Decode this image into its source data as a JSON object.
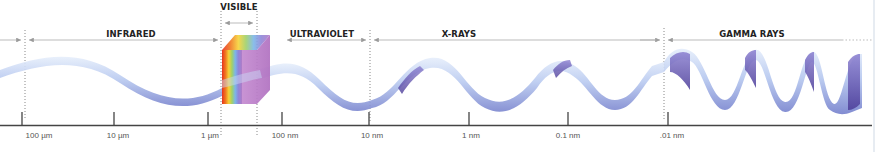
{
  "diagram": {
    "type": "electromagnetic-spectrum",
    "bands": [
      {
        "id": "infrared",
        "label": "INFRARED",
        "x_center": 123,
        "y": 29
      },
      {
        "id": "visible",
        "label": "VISIBLE",
        "x_center": 239,
        "y": 2
      },
      {
        "id": "ultraviolet",
        "label": "ULTRAVIOLET",
        "x_center": 313,
        "y": 29
      },
      {
        "id": "x-rays",
        "label": "X-RAYS",
        "x_center": 458,
        "y": 29
      },
      {
        "id": "gamma-rays",
        "label": "GAMMA RAYS",
        "x_center": 753,
        "y": 29
      }
    ],
    "axis": {
      "ticks": [
        {
          "x": 22,
          "label": "100 µm",
          "label_x": 39
        },
        {
          "x": 114,
          "label": "10 µm",
          "label_x": 118
        },
        {
          "x": 208,
          "label": "1 µm",
          "label_x": 210
        },
        {
          "x": 282,
          "label": "100 nm",
          "label_x": 285
        },
        {
          "x": 369,
          "label": "10 nm",
          "label_x": 372
        },
        {
          "x": 469,
          "label": "1 nm",
          "label_x": 471
        },
        {
          "x": 568,
          "label": "0.1 nm",
          "label_x": 568
        },
        {
          "x": 668,
          "label": ".01 nm",
          "label_x": 672
        }
      ]
    },
    "dividers_x": [
      25,
      221,
      257,
      370,
      664
    ],
    "colors": {
      "wave_light": "#dfe9f8",
      "wave_mid": "#9fb5e4",
      "wave_dark": "#6b6fbf",
      "wave_shadow": "#5a3f9a",
      "axis": "#444444",
      "arrow": "#9a9a9a",
      "prism_purple": "#c27cc9"
    }
  }
}
